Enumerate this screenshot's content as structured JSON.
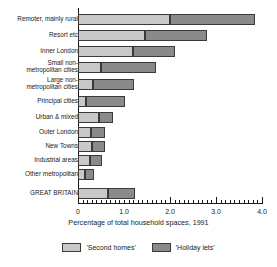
{
  "chart_data": {
    "type": "bar",
    "orientation": "horizontal",
    "stacked": true,
    "title": "",
    "xlabel": "Percentage of total household spaces, 1991",
    "ylabel": "",
    "xlim": [
      0,
      4.0
    ],
    "xticks": [
      "0",
      "1.0",
      "2.0",
      "3.0",
      "4.0"
    ],
    "xtick_values": [
      0,
      1.0,
      2.0,
      3.0,
      4.0
    ],
    "grid": false,
    "legend_position": "bottom",
    "categories": [
      "Remoter, mainly rural",
      "Resort etc",
      "Inner London",
      "Small non-\nmetropolitan cities",
      "Large non-\nmetropolitan cities",
      "Principal cities",
      "Urban & mixed",
      "Outer London",
      "New Towns",
      "Industrial areas",
      "Other metropolitan",
      "GREAT BRITAIN"
    ],
    "series": [
      {
        "name": "'Second homes'",
        "color": "#c9c9c9",
        "values": [
          2.0,
          1.45,
          1.2,
          0.5,
          0.33,
          0.17,
          0.45,
          0.28,
          0.3,
          0.27,
          0.15,
          0.65
        ]
      },
      {
        "name": "'Holiday lets'",
        "color": "#8a8a8a",
        "values": [
          1.85,
          1.35,
          0.9,
          1.2,
          0.89,
          0.85,
          0.32,
          0.31,
          0.28,
          0.26,
          0.2,
          0.6
        ]
      }
    ],
    "totals": [
      3.85,
      2.8,
      2.1,
      1.7,
      1.22,
      1.02,
      0.77,
      0.59,
      0.58,
      0.53,
      0.35,
      1.25
    ]
  },
  "legend": {
    "items": [
      {
        "label": "'Second homes'",
        "color": "#c9c9c9"
      },
      {
        "label": "'Holiday lets'",
        "color": "#8a8a8a"
      }
    ]
  },
  "axis": {
    "title": "Percentage of total household spaces, 1991",
    "ticks": [
      "0",
      "1.0",
      "2.0",
      "3.0",
      "4.0"
    ]
  }
}
